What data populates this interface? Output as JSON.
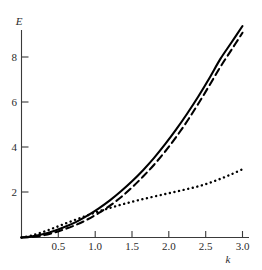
{
  "chart_data": {
    "type": "line",
    "title": "",
    "xlabel": "k",
    "ylabel": "E",
    "xlim": [
      0,
      3.0
    ],
    "ylim": [
      0,
      9.4
    ],
    "grid": false,
    "legend": "none",
    "xticks": [
      "0.5",
      "1.0",
      "1.5",
      "2.0",
      "2.5",
      "3.0"
    ],
    "xtick_values": [
      0.5,
      1.0,
      1.5,
      2.0,
      2.5,
      3.0
    ],
    "yticks": [
      "2",
      "4",
      "6",
      "8"
    ],
    "ytick_values": [
      2,
      4,
      6,
      8
    ],
    "x": [
      0.0,
      0.15,
      0.3,
      0.45,
      0.6,
      0.75,
      0.9,
      1.05,
      1.2,
      1.35,
      1.5,
      1.65,
      1.8,
      1.95,
      2.1,
      2.25,
      2.4,
      2.55,
      2.7,
      2.85,
      3.0
    ],
    "series": [
      {
        "name": "solid-curve",
        "style": "solid",
        "color": "#000000",
        "values": [
          0.0,
          0.05,
          0.15,
          0.3,
          0.48,
          0.7,
          0.97,
          1.28,
          1.63,
          2.03,
          2.47,
          2.96,
          3.5,
          4.1,
          4.75,
          5.45,
          6.2,
          7.0,
          7.85,
          8.57,
          9.3
        ]
      },
      {
        "name": "dashed-curve",
        "style": "dashed",
        "color": "#000000",
        "values": [
          0.0,
          0.03,
          0.1,
          0.22,
          0.38,
          0.57,
          0.8,
          1.08,
          1.4,
          1.77,
          2.2,
          2.68,
          3.2,
          3.78,
          4.42,
          5.12,
          5.88,
          6.68,
          7.5,
          8.25,
          9.0
        ]
      },
      {
        "name": "dotted-curve",
        "style": "dotted",
        "color": "#000000",
        "values": [
          0.0,
          0.1,
          0.25,
          0.43,
          0.62,
          0.8,
          0.98,
          1.15,
          1.3,
          1.44,
          1.57,
          1.69,
          1.8,
          1.91,
          2.02,
          2.13,
          2.25,
          2.4,
          2.58,
          2.78,
          3.0
        ]
      }
    ],
    "annotations": []
  },
  "axis": {
    "y_label": "E",
    "x_label": "k"
  }
}
